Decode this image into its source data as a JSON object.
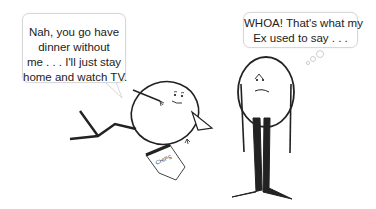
{
  "comic": {
    "left_character": {
      "speech_bubble": {
        "lines": [
          "Nah, you go have",
          "dinner without",
          "me . . . I'll just stay",
          "home and watch TV."
        ]
      },
      "pose": "reclining",
      "prop_label": "CHIPS"
    },
    "right_character": {
      "thought_bubble": {
        "lines": [
          "WHOA! That's what my",
          "Ex used to say . . ."
        ]
      },
      "pose": "standing"
    }
  }
}
